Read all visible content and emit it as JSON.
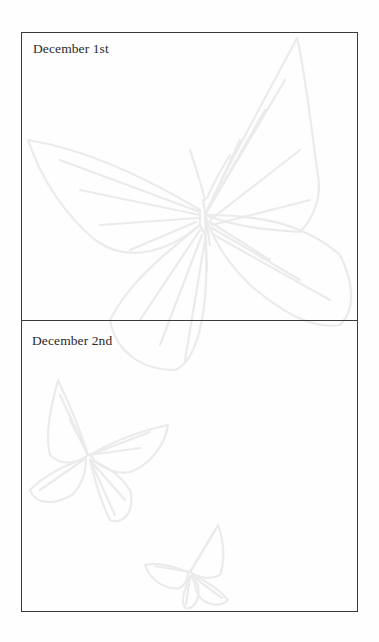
{
  "page": {
    "background_color": "#fefefe",
    "border_color": "#3a3a3a",
    "watermark": "butterfly-illustrations"
  },
  "entries": [
    {
      "label": "December 1st",
      "content": ""
    },
    {
      "label": "December 2nd",
      "content": ""
    }
  ],
  "decorations": {
    "butterfly_outline_color": "#ececec",
    "items": [
      "large-butterfly",
      "medium-butterfly",
      "small-butterfly"
    ]
  }
}
